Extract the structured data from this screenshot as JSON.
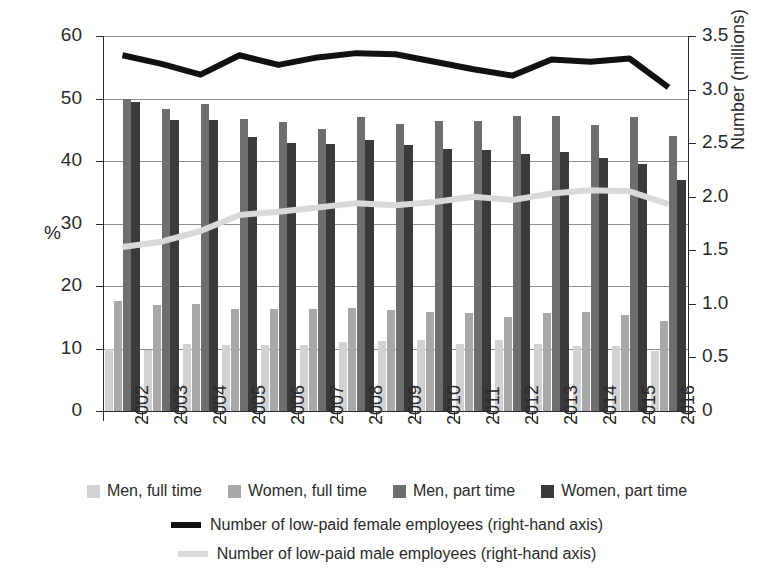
{
  "chart_data": {
    "type": "bar",
    "title": "",
    "xlabel": "",
    "ylabel": "%",
    "y2label": "Number (millions)",
    "ylim": [
      0,
      60
    ],
    "y2lim": [
      0,
      3.5
    ],
    "grid": true,
    "legend_position": "bottom",
    "categories": [
      "2002",
      "2003",
      "2004",
      "2005",
      "2006",
      "2007",
      "2008",
      "2009",
      "2010",
      "2011",
      "2012",
      "2013",
      "2014",
      "2015",
      "2016"
    ],
    "yticks": [
      "0",
      "10",
      "20",
      "30",
      "40",
      "50",
      "60"
    ],
    "y2ticks": [
      "0",
      "0.5",
      "1.0",
      "1.5",
      "2.0",
      "2.5",
      "3.0",
      "3.5"
    ],
    "series": [
      {
        "name": "Men, full time",
        "axis": "left",
        "color": "#d2d2d2",
        "values": [
          10.0,
          9.8,
          10.8,
          10.6,
          10.6,
          10.6,
          11.0,
          11.2,
          11.3,
          10.8,
          11.3,
          10.8,
          10.4,
          10.4,
          9.6
        ]
      },
      {
        "name": "Women, full time",
        "axis": "left",
        "color": "#a8a8a8",
        "values": [
          17.6,
          17.0,
          17.1,
          16.4,
          16.3,
          16.4,
          16.5,
          16.1,
          15.8,
          15.7,
          15.0,
          15.7,
          15.8,
          15.4,
          14.4
        ]
      },
      {
        "name": "Men, part time",
        "axis": "left",
        "color": "#6e6e6e",
        "values": [
          49.9,
          48.4,
          49.1,
          46.8,
          46.2,
          45.1,
          47.0,
          46.0,
          46.4,
          46.4,
          47.2,
          47.2,
          45.8,
          47.0,
          44.0
        ]
      },
      {
        "name": "Women, part time",
        "axis": "left",
        "color": "#3a3a3a",
        "values": [
          49.4,
          46.5,
          46.5,
          43.9,
          42.9,
          42.8,
          43.3,
          42.6,
          41.9,
          41.7,
          41.1,
          41.4,
          40.5,
          39.6,
          37.0
        ]
      }
    ],
    "lines": [
      {
        "name": "Number of low-paid female employees (right-hand axis)",
        "axis": "right",
        "color": "#111111",
        "values": [
          3.32,
          3.24,
          3.14,
          3.32,
          3.23,
          3.3,
          3.34,
          3.33,
          3.26,
          3.19,
          3.13,
          3.28,
          3.26,
          3.29,
          3.02
        ]
      },
      {
        "name": "Number of low-paid male employees (right-hand axis)",
        "axis": "right",
        "color": "#d9d9d9",
        "values": [
          1.53,
          1.58,
          1.68,
          1.83,
          1.86,
          1.9,
          1.94,
          1.92,
          1.95,
          2.0,
          1.97,
          2.03,
          2.06,
          2.05,
          1.93
        ]
      }
    ]
  },
  "legend": {
    "bars": [
      {
        "label": "Men, full time",
        "color": "#d2d2d2"
      },
      {
        "label": "Women, full time",
        "color": "#a8a8a8"
      },
      {
        "label": "Men, part time",
        "color": "#6e6e6e"
      },
      {
        "label": "Women, part time",
        "color": "#3a3a3a"
      }
    ],
    "lines": [
      {
        "label": "Number of low-paid female employees (right-hand axis)",
        "color": "#111111"
      },
      {
        "label": "Number of low-paid male employees (right-hand axis)",
        "color": "#d9d9d9"
      }
    ]
  }
}
